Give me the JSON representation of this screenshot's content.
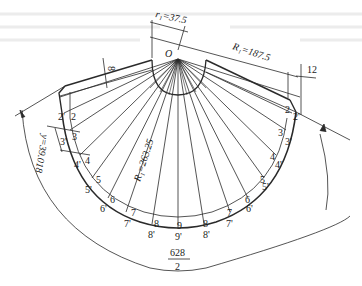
{
  "figure": {
    "type": "sheet-metal development (unfolded truncated cone with flange band)",
    "center_label": "O",
    "dimensions": {
      "r1": "r₁=37.5",
      "R1": "R₁=187.5",
      "R_total": "R₁=263.25",
      "thickness_top": "8",
      "thickness_right": "12",
      "y_offset": "y=39.018",
      "arc_length_numerator": "628",
      "arc_length_denominator": "2"
    },
    "points_inner": [
      "2",
      "3",
      "4",
      "5",
      "6",
      "7",
      "8",
      "9",
      "8",
      "7",
      "6",
      "5",
      "4",
      "3",
      "2"
    ],
    "points_outer": [
      "2'",
      "3'",
      "4'",
      "5'",
      "6'",
      "7'",
      "8'",
      "9'",
      "8'",
      "7'",
      "6'",
      "5'",
      "4'",
      "3'",
      "2'"
    ],
    "colors": {
      "line": "#2a2a2a",
      "background": "#ffffff",
      "bleed_text": "#e6e6e6"
    }
  }
}
